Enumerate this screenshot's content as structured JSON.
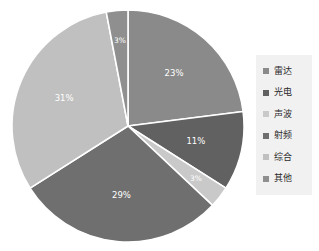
{
  "chart_data": {
    "type": "pie",
    "title": "",
    "subtitle": "",
    "xlabel": "",
    "ylabel": "",
    "grid": false,
    "legend_position": "right",
    "start_angle_deg": 0,
    "direction": "clockwise",
    "categories": [
      "雷达",
      "光电",
      "声波",
      "射频",
      "综合",
      "其他"
    ],
    "values": [
      23,
      11,
      3,
      29,
      31,
      3
    ],
    "labels": [
      "23%",
      "11%",
      "3%",
      "29%",
      "31%",
      "3%"
    ],
    "colors": [
      "#8a8a8a",
      "#616161",
      "#c9c9c9",
      "#6f6f6f",
      "#c0c0c0",
      "#8f8f8f"
    ],
    "slices": [
      {
        "name": "雷达",
        "value": 23,
        "label": "23%",
        "color": "#8a8a8a"
      },
      {
        "name": "光电",
        "value": 11,
        "label": "11%",
        "color": "#616161"
      },
      {
        "name": "声波",
        "value": 3,
        "label": "3%",
        "color": "#c9c9c9"
      },
      {
        "name": "射频",
        "value": 29,
        "label": "29%",
        "color": "#6f6f6f"
      },
      {
        "name": "综合",
        "value": 31,
        "label": "31%",
        "color": "#c0c0c0"
      },
      {
        "name": "其他",
        "value": 3,
        "label": "3%",
        "color": "#8f8f8f"
      }
    ]
  },
  "legend": {
    "background": "#f1f1f1",
    "items": [
      {
        "label": "雷达",
        "color": "#8a8a8a"
      },
      {
        "label": "光电",
        "color": "#616161"
      },
      {
        "label": "声波",
        "color": "#c9c9c9"
      },
      {
        "label": "射频",
        "color": "#6f6f6f"
      },
      {
        "label": "综合",
        "color": "#c0c0c0"
      },
      {
        "label": "其他",
        "color": "#8f8f8f"
      }
    ]
  }
}
